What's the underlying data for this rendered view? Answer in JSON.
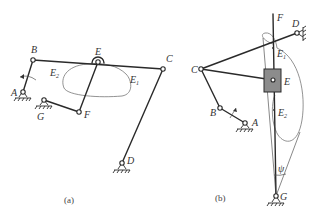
{
  "figure_a": {
    "caption": "(a)",
    "labels": {
      "A": "A",
      "B": "B",
      "C": "C",
      "D": "D",
      "E": "E",
      "F": "F",
      "G": "G",
      "E1": "E",
      "E1_sub": "1",
      "E2": "E",
      "E2_sub": "2"
    }
  },
  "figure_b": {
    "caption": "(b)",
    "labels": {
      "A": "A",
      "B": "B",
      "C": "C",
      "D": "D",
      "E": "E",
      "F": "F",
      "G": "G",
      "E1": "E",
      "E1_sub": "1",
      "E2": "E",
      "E2_sub": "2",
      "psi": "ψ"
    }
  },
  "colors": {
    "line": "#2a2a2a",
    "curve": "#777777",
    "slider_block": "#8c8c8c"
  }
}
